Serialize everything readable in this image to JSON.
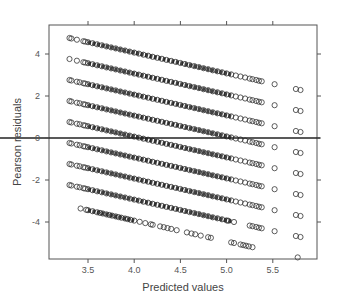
{
  "chart_data": {
    "type": "scatter",
    "title": "",
    "xlabel": "Predicted values",
    "ylabel": "Pearson residuals",
    "xlim": [
      3.1,
      6.0
    ],
    "ylim": [
      -5.6,
      5.5
    ],
    "x_ticks": [
      3.5,
      4.0,
      4.5,
      5.0,
      5.5
    ],
    "x_tick_labels": [
      "3.5",
      "4.0",
      "4.5",
      "5.0",
      "5.5"
    ],
    "y_ticks": [
      -4,
      -2,
      0,
      2,
      4
    ],
    "y_tick_labels": [
      "-4",
      "-2",
      "0",
      "2",
      "4"
    ],
    "grid": false,
    "legend": null,
    "reference_line": {
      "y": 0,
      "style": "solid",
      "color": "#222222"
    },
    "marker": {
      "shape": "open-circle",
      "color": "#333333"
    },
    "series": [
      {
        "name": "band_1",
        "intercept_at_3.3": 4.76,
        "slope": -0.99,
        "points_x": [
          3.3,
          3.32,
          3.38,
          3.45,
          3.47,
          3.5,
          3.55,
          3.6,
          3.65,
          3.7,
          3.75,
          3.8,
          3.85,
          3.9,
          3.95,
          4.0,
          4.05,
          4.1,
          4.15,
          4.2,
          4.25,
          4.3,
          4.35,
          4.4,
          4.45,
          4.5,
          4.55,
          4.6,
          4.65,
          4.7,
          4.75,
          4.8,
          4.85,
          4.9,
          4.95,
          5.0,
          5.05,
          5.1,
          5.15,
          5.2,
          5.25,
          5.28,
          5.32,
          5.35,
          5.38,
          5.52,
          5.75,
          5.8
        ]
      },
      {
        "name": "band_2",
        "intercept_at_3.3": 3.76,
        "slope": -0.99,
        "points_x": [
          3.3,
          3.38,
          3.45,
          3.47,
          3.5,
          3.55,
          3.6,
          3.65,
          3.7,
          3.75,
          3.8,
          3.85,
          3.9,
          3.95,
          4.0,
          4.05,
          4.1,
          4.15,
          4.2,
          4.25,
          4.3,
          4.35,
          4.4,
          4.45,
          4.5,
          4.55,
          4.6,
          4.65,
          4.7,
          4.75,
          4.8,
          4.85,
          4.9,
          4.95,
          5.0,
          5.05,
          5.1,
          5.15,
          5.2,
          5.25,
          5.28,
          5.32,
          5.35,
          5.38,
          5.52,
          5.75,
          5.8
        ]
      },
      {
        "name": "band_3",
        "intercept_at_3.3": 2.76,
        "slope": -0.99,
        "points_x": [
          3.3,
          3.32,
          3.38,
          3.41,
          3.45,
          3.47,
          3.5,
          3.55,
          3.6,
          3.65,
          3.7,
          3.75,
          3.8,
          3.85,
          3.9,
          3.95,
          4.0,
          4.05,
          4.1,
          4.15,
          4.2,
          4.25,
          4.3,
          4.35,
          4.4,
          4.45,
          4.5,
          4.55,
          4.6,
          4.65,
          4.7,
          4.75,
          4.8,
          4.85,
          4.9,
          4.95,
          5.0,
          5.05,
          5.1,
          5.15,
          5.2,
          5.25,
          5.28,
          5.32,
          5.35,
          5.38,
          5.52,
          5.75,
          5.8
        ]
      },
      {
        "name": "band_4",
        "intercept_at_3.3": 1.76,
        "slope": -0.99,
        "points_x": [
          3.3,
          3.32,
          3.38,
          3.41,
          3.45,
          3.47,
          3.5,
          3.55,
          3.6,
          3.65,
          3.7,
          3.75,
          3.8,
          3.85,
          3.9,
          3.95,
          4.0,
          4.05,
          4.1,
          4.15,
          4.2,
          4.25,
          4.3,
          4.35,
          4.4,
          4.45,
          4.5,
          4.55,
          4.6,
          4.65,
          4.7,
          4.75,
          4.8,
          4.85,
          4.9,
          4.95,
          5.0,
          5.05,
          5.1,
          5.15,
          5.2,
          5.25,
          5.28,
          5.32,
          5.35,
          5.38,
          5.52,
          5.75,
          5.8
        ]
      },
      {
        "name": "band_5",
        "intercept_at_3.3": 0.76,
        "slope": -0.99,
        "points_x": [
          3.3,
          3.32,
          3.38,
          3.41,
          3.45,
          3.47,
          3.5,
          3.55,
          3.6,
          3.65,
          3.7,
          3.75,
          3.8,
          3.85,
          3.9,
          3.95,
          4.0,
          4.05,
          4.1,
          4.15,
          4.2,
          4.25,
          4.3,
          4.35,
          4.4,
          4.45,
          4.5,
          4.55,
          4.6,
          4.65,
          4.7,
          4.75,
          4.8,
          4.85,
          4.9,
          4.95,
          5.0,
          5.05,
          5.1,
          5.15,
          5.2,
          5.25,
          5.28,
          5.32,
          5.35,
          5.38,
          5.52,
          5.75,
          5.8
        ]
      },
      {
        "name": "band_6",
        "intercept_at_3.3": -0.24,
        "slope": -0.99,
        "points_x": [
          3.3,
          3.32,
          3.38,
          3.41,
          3.45,
          3.47,
          3.5,
          3.55,
          3.6,
          3.65,
          3.7,
          3.75,
          3.8,
          3.85,
          3.9,
          3.95,
          4.0,
          4.05,
          4.1,
          4.15,
          4.2,
          4.25,
          4.3,
          4.35,
          4.4,
          4.45,
          4.5,
          4.55,
          4.6,
          4.65,
          4.7,
          4.75,
          4.8,
          4.85,
          4.9,
          4.95,
          5.0,
          5.05,
          5.1,
          5.15,
          5.2,
          5.25,
          5.28,
          5.32,
          5.35,
          5.38,
          5.52,
          5.75,
          5.8
        ]
      },
      {
        "name": "band_7",
        "intercept_at_3.3": -1.24,
        "slope": -0.99,
        "points_x": [
          3.3,
          3.32,
          3.38,
          3.41,
          3.45,
          3.47,
          3.5,
          3.55,
          3.6,
          3.65,
          3.7,
          3.75,
          3.8,
          3.85,
          3.9,
          3.95,
          4.0,
          4.05,
          4.1,
          4.15,
          4.2,
          4.25,
          4.3,
          4.35,
          4.4,
          4.45,
          4.5,
          4.55,
          4.6,
          4.65,
          4.7,
          4.75,
          4.8,
          4.85,
          4.9,
          4.95,
          5.0,
          5.05,
          5.1,
          5.15,
          5.2,
          5.25,
          5.28,
          5.32,
          5.35,
          5.38,
          5.52,
          5.75,
          5.8
        ]
      },
      {
        "name": "band_8",
        "intercept_at_3.3": -2.24,
        "slope": -0.99,
        "points_x": [
          3.3,
          3.32,
          3.38,
          3.41,
          3.45,
          3.47,
          3.5,
          3.55,
          3.6,
          3.65,
          3.7,
          3.75,
          3.8,
          3.85,
          3.9,
          3.95,
          4.0,
          4.05,
          4.1,
          4.15,
          4.2,
          4.25,
          4.3,
          4.35,
          4.4,
          4.45,
          4.5,
          4.55,
          4.6,
          4.65,
          4.7,
          4.75,
          4.8,
          4.85,
          4.9,
          4.95,
          5.0,
          5.02,
          5.08,
          5.25,
          5.28,
          5.32,
          5.35,
          5.38,
          5.52,
          5.75,
          5.8
        ]
      },
      {
        "name": "band_9",
        "intercept_at_3.3": -3.24,
        "slope": -0.99,
        "points_x": [
          3.42,
          3.48,
          3.5,
          3.55,
          3.6,
          3.63,
          3.66,
          3.7,
          3.73,
          3.76,
          3.8,
          3.83,
          3.86,
          3.9,
          3.93,
          3.96,
          4.0,
          4.06,
          4.12,
          4.18,
          4.2,
          4.28,
          4.32,
          4.36,
          4.4,
          4.46,
          4.57,
          4.62,
          4.66,
          4.72,
          4.8,
          4.83,
          5.05,
          5.08,
          5.15,
          5.18,
          5.21,
          5.24,
          5.28,
          5.77
        ]
      }
    ]
  },
  "axes": {
    "x_title": "Predicted values",
    "y_title": "Pearson residuals"
  }
}
